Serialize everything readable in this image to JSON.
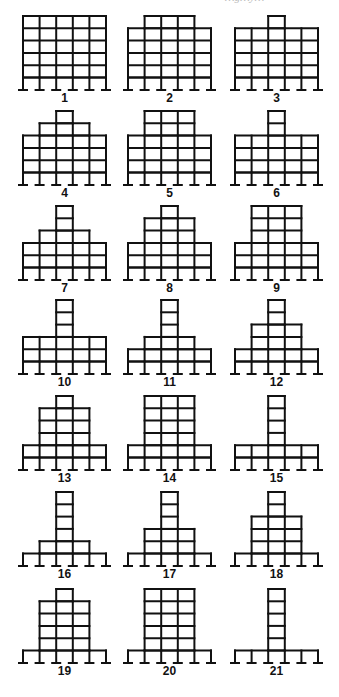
{
  "figure": {
    "caption_partial": "…g…y…",
    "bays": 5,
    "open_ground_story": true,
    "frames": [
      {
        "label": "1",
        "tiers": [
          {
            "bays": 5,
            "stories": 5
          }
        ]
      },
      {
        "label": "2",
        "tiers": [
          {
            "bays": 5,
            "stories": 4
          },
          {
            "bays": 3,
            "stories": 1
          }
        ]
      },
      {
        "label": "3",
        "tiers": [
          {
            "bays": 5,
            "stories": 4
          },
          {
            "bays": 1,
            "stories": 1
          }
        ]
      },
      {
        "label": "4",
        "tiers": [
          {
            "bays": 5,
            "stories": 3
          },
          {
            "bays": 3,
            "stories": 1
          },
          {
            "bays": 1,
            "stories": 1
          }
        ]
      },
      {
        "label": "5",
        "tiers": [
          {
            "bays": 5,
            "stories": 3
          },
          {
            "bays": 3,
            "stories": 2
          }
        ]
      },
      {
        "label": "6",
        "tiers": [
          {
            "bays": 5,
            "stories": 3
          },
          {
            "bays": 1,
            "stories": 2
          }
        ]
      },
      {
        "label": "7",
        "tiers": [
          {
            "bays": 5,
            "stories": 2
          },
          {
            "bays": 3,
            "stories": 1
          },
          {
            "bays": 1,
            "stories": 2
          }
        ]
      },
      {
        "label": "8",
        "tiers": [
          {
            "bays": 5,
            "stories": 2
          },
          {
            "bays": 3,
            "stories": 2
          },
          {
            "bays": 1,
            "stories": 1
          }
        ]
      },
      {
        "label": "9",
        "tiers": [
          {
            "bays": 5,
            "stories": 2
          },
          {
            "bays": 3,
            "stories": 3
          }
        ]
      },
      {
        "label": "10",
        "tiers": [
          {
            "bays": 5,
            "stories": 2
          },
          {
            "bays": 1,
            "stories": 3
          }
        ]
      },
      {
        "label": "11",
        "tiers": [
          {
            "bays": 5,
            "stories": 1
          },
          {
            "bays": 3,
            "stories": 1
          },
          {
            "bays": 1,
            "stories": 3
          }
        ]
      },
      {
        "label": "12",
        "tiers": [
          {
            "bays": 5,
            "stories": 1
          },
          {
            "bays": 3,
            "stories": 2
          },
          {
            "bays": 1,
            "stories": 2
          }
        ]
      },
      {
        "label": "13",
        "tiers": [
          {
            "bays": 5,
            "stories": 1
          },
          {
            "bays": 3,
            "stories": 3
          },
          {
            "bays": 1,
            "stories": 1
          }
        ]
      },
      {
        "label": "14",
        "tiers": [
          {
            "bays": 5,
            "stories": 1
          },
          {
            "bays": 3,
            "stories": 4
          }
        ]
      },
      {
        "label": "15",
        "tiers": [
          {
            "bays": 5,
            "stories": 1
          },
          {
            "bays": 1,
            "stories": 4
          }
        ]
      },
      {
        "label": "16",
        "tiers": [
          {
            "bays": 3,
            "stories": 1
          },
          {
            "bays": 1,
            "stories": 4
          }
        ]
      },
      {
        "label": "17",
        "tiers": [
          {
            "bays": 3,
            "stories": 2
          },
          {
            "bays": 1,
            "stories": 3
          }
        ]
      },
      {
        "label": "18",
        "tiers": [
          {
            "bays": 3,
            "stories": 3
          },
          {
            "bays": 1,
            "stories": 2
          }
        ]
      },
      {
        "label": "19",
        "tiers": [
          {
            "bays": 3,
            "stories": 4
          },
          {
            "bays": 1,
            "stories": 1
          }
        ]
      },
      {
        "label": "20",
        "tiers": [
          {
            "bays": 3,
            "stories": 5
          }
        ]
      },
      {
        "label": "21",
        "tiers": [
          {
            "bays": 1,
            "stories": 5
          }
        ]
      }
    ]
  }
}
